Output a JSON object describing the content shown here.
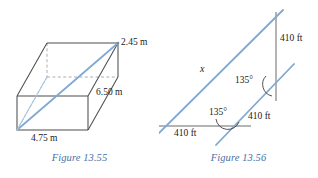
{
  "page": {
    "background_color": "#ffffff",
    "width": 318,
    "height": 178
  },
  "colors": {
    "diagram_line_blue": "#7fa8d4",
    "outline_gray": "#555555",
    "dashed_gray": "#8a8a8a",
    "caption_blue": "#4a6fa5",
    "label_black": "#1a1a1a"
  },
  "figures": [
    {
      "id": "figure-13-55",
      "caption": "Figure 13.55",
      "type": "rectangular-box-with-space-diagonal",
      "labels": [
        {
          "name": "height-label",
          "text": "2.45 m"
        },
        {
          "name": "length-label",
          "text": "6.50 m"
        },
        {
          "name": "width-label",
          "text": "4.75 m"
        }
      ]
    },
    {
      "id": "figure-13-56",
      "caption": "Figure 13.56",
      "type": "parallel-lines-with-transversals",
      "labels": [
        {
          "name": "upper-segment-label",
          "text": "410 ft"
        },
        {
          "name": "middle-angle-label",
          "text": "135°"
        },
        {
          "name": "middle-segment-label",
          "text": "410 ft"
        },
        {
          "name": "lower-angle-label",
          "text": "135°"
        },
        {
          "name": "lower-segment-label",
          "text": "410 ft"
        },
        {
          "name": "unknown-length-label",
          "text": "x"
        }
      ]
    }
  ],
  "figure_box": {
    "caption": "Figure 13.55",
    "height_label": "2.45 m",
    "length_label": "6.50 m",
    "width_label": "4.75 m"
  },
  "figure_lines": {
    "caption": "Figure 13.56",
    "top_distance_label": "410 ft",
    "upper_angle_label": "135°",
    "right_distance_label": "410 ft",
    "lower_angle_label": "135°",
    "bottom_distance_label": "410 ft",
    "x_label": "x"
  }
}
